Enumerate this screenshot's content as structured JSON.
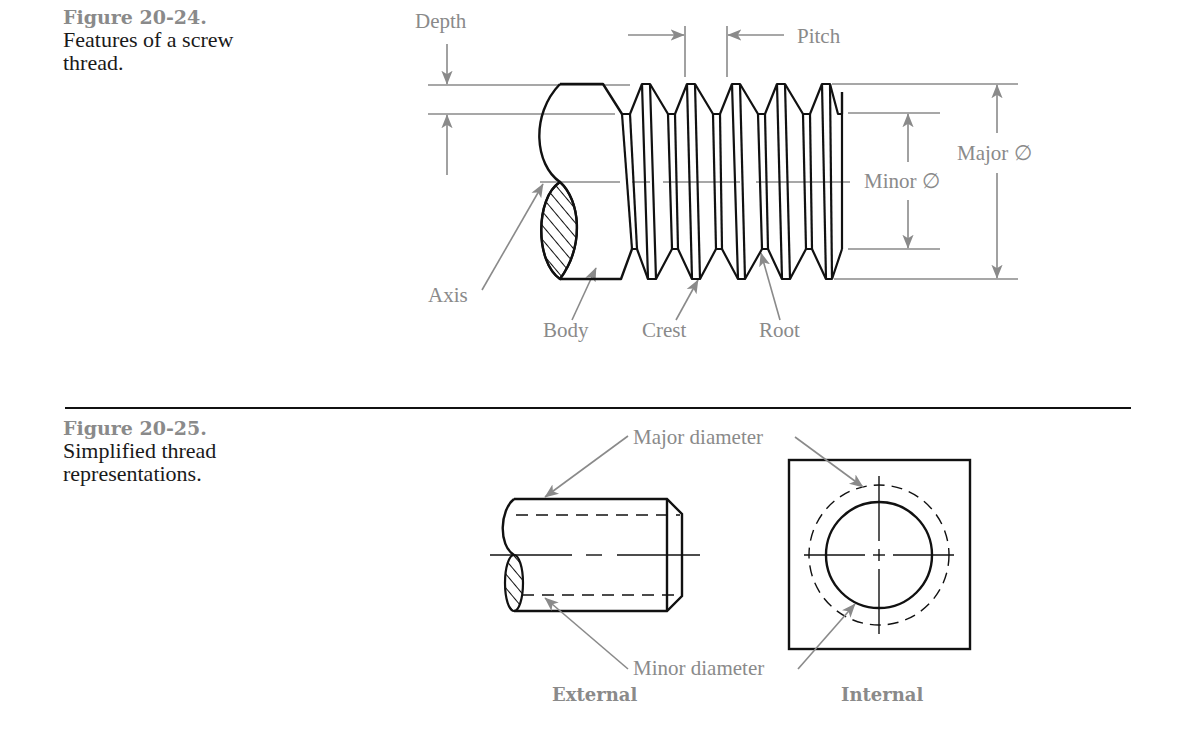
{
  "figures": [
    {
      "number": "Figure 20-24.",
      "caption_line1": "Features of a screw",
      "caption_line2": "thread.",
      "labels": {
        "depth": "Depth",
        "pitch": "Pitch",
        "major": "Major ∅",
        "minor": "Minor ∅",
        "axis": "Axis",
        "body": "Body",
        "crest": "Crest",
        "root": "Root"
      }
    },
    {
      "number": "Figure 20-25.",
      "caption_line1": "Simplified thread",
      "caption_line2": "representations.",
      "labels": {
        "major_diameter": "Major diameter",
        "minor_diameter": "Minor diameter",
        "external": "External",
        "internal": "Internal"
      }
    }
  ],
  "colors": {
    "annotation_gray": "#8a8a8a",
    "line_black": "#111111",
    "rule": "#111111"
  }
}
